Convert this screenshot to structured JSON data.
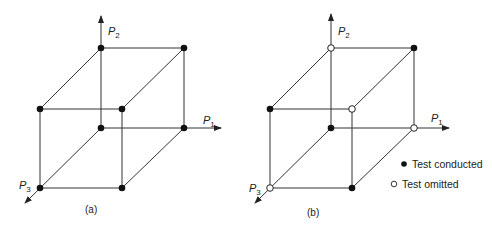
{
  "panels": [
    {
      "id": "a",
      "caption": "(a)",
      "axes": {
        "x": "P",
        "x_sub": "1",
        "y": "P",
        "y_sub": "2",
        "z": "P",
        "z_sub": "3"
      },
      "vertices": {
        "back_bottom_left": "conducted",
        "back_bottom_right": "conducted",
        "back_top_left": "conducted",
        "back_top_right": "conducted",
        "front_bottom_left": "conducted",
        "front_bottom_right": "conducted",
        "front_top_left": "conducted",
        "front_top_right": "conducted"
      }
    },
    {
      "id": "b",
      "caption": "(b)",
      "axes": {
        "x": "P",
        "x_sub": "1",
        "y": "P",
        "y_sub": "2",
        "z": "P",
        "z_sub": "3"
      },
      "vertices": {
        "back_bottom_left": "conducted",
        "back_bottom_right": "omitted",
        "back_top_left": "omitted",
        "back_top_right": "conducted",
        "front_bottom_left": "omitted",
        "front_bottom_right": "conducted",
        "front_top_left": "conducted",
        "front_top_right": "omitted"
      }
    }
  ],
  "legend": {
    "conducted": "Test conducted",
    "omitted": "Test omitted"
  },
  "colors": {
    "line": "#333333",
    "dot": "#111111",
    "hollow_fill": "#ffffff"
  }
}
